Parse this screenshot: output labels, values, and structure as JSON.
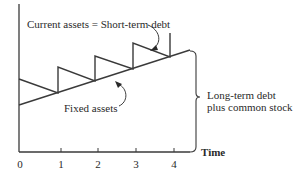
{
  "diagram": {
    "labels": {
      "top": "Current assets = Short-term debt",
      "fixed": "Fixed assets",
      "brace_line1": "Long-term debt",
      "brace_line2": "plus common stock",
      "x_axis": "Time"
    },
    "x_ticks": [
      "0",
      "1",
      "2",
      "3",
      "4"
    ],
    "colors": {
      "line": "#3a3a3a",
      "background": "#ffffff"
    }
  }
}
